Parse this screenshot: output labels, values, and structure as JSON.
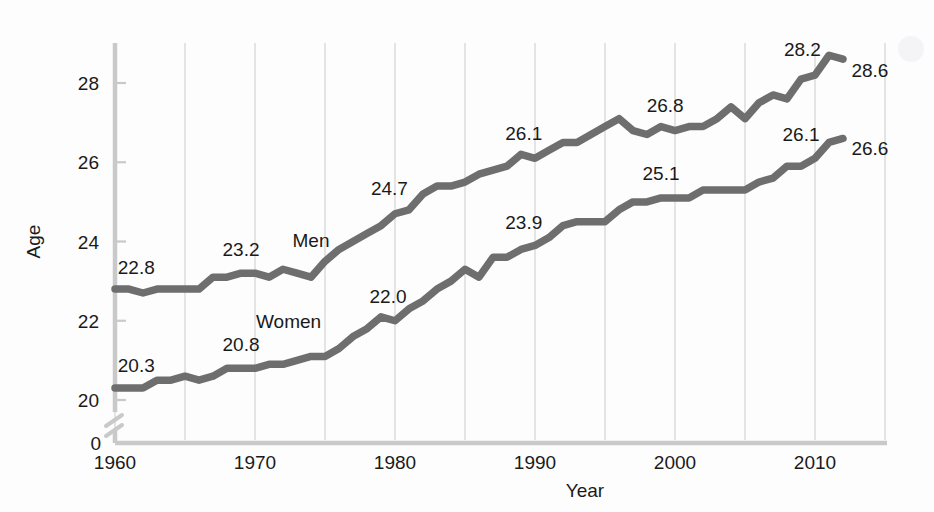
{
  "chart_data": {
    "type": "line",
    "title": "",
    "xlabel": "Year",
    "ylabel": "Age",
    "xlim": [
      1960,
      2015
    ],
    "ylim": [
      19.5,
      29.2
    ],
    "grid": "vertical",
    "legend_position": "inline-labels",
    "xticks": [
      "1960",
      "1970",
      "1980",
      "1990",
      "2000",
      "2010"
    ],
    "xtick_values": [
      1960,
      1970,
      1980,
      1990,
      2000,
      2010
    ],
    "yticks": [
      "0",
      "20",
      "22",
      "24",
      "26",
      "28"
    ],
    "ytick_values": [
      0,
      20,
      22,
      24,
      26,
      28
    ],
    "axis_break": true,
    "line_color": "#6e6e6e",
    "axis_color": "#c9c9c9",
    "grid_color": "#d9d9d9",
    "series": [
      {
        "name": "Men",
        "label_x": 1974.0,
        "label_y": 24.05,
        "x": [
          1960,
          1961,
          1962,
          1963,
          1964,
          1965,
          1966,
          1967,
          1968,
          1969,
          1970,
          1971,
          1972,
          1973,
          1974,
          1975,
          1976,
          1977,
          1978,
          1979,
          1980,
          1981,
          1982,
          1983,
          1984,
          1985,
          1986,
          1987,
          1988,
          1989,
          1990,
          1991,
          1992,
          1993,
          1994,
          1995,
          1996,
          1997,
          1998,
          1999,
          2000,
          2001,
          2002,
          2003,
          2004,
          2005,
          2006,
          2007,
          2008,
          2009,
          2010,
          2011,
          2012
        ],
        "values": [
          22.8,
          22.8,
          22.7,
          22.8,
          22.8,
          22.8,
          22.8,
          23.1,
          23.1,
          23.2,
          23.2,
          23.1,
          23.3,
          23.2,
          23.1,
          23.5,
          23.8,
          24.0,
          24.2,
          24.4,
          24.7,
          24.8,
          25.2,
          25.4,
          25.4,
          25.5,
          25.7,
          25.8,
          25.9,
          26.2,
          26.1,
          26.3,
          26.5,
          26.5,
          26.7,
          26.9,
          27.1,
          26.8,
          26.7,
          26.9,
          26.8,
          26.9,
          26.9,
          27.1,
          27.4,
          27.1,
          27.5,
          27.7,
          27.6,
          28.1,
          28.2,
          28.7,
          28.6
        ]
      },
      {
        "name": "Women",
        "label_x": 1972.4,
        "label_y": 22.0,
        "x": [
          1960,
          1961,
          1962,
          1963,
          1964,
          1965,
          1966,
          1967,
          1968,
          1969,
          1970,
          1971,
          1972,
          1973,
          1974,
          1975,
          1976,
          1977,
          1978,
          1979,
          1980,
          1981,
          1982,
          1983,
          1984,
          1985,
          1986,
          1987,
          1988,
          1989,
          1990,
          1991,
          1992,
          1993,
          1994,
          1995,
          1996,
          1997,
          1998,
          1999,
          2000,
          2001,
          2002,
          2003,
          2004,
          2005,
          2006,
          2007,
          2008,
          2009,
          2010,
          2011,
          2012
        ],
        "values": [
          20.3,
          20.3,
          20.3,
          20.5,
          20.5,
          20.6,
          20.5,
          20.6,
          20.8,
          20.8,
          20.8,
          20.9,
          20.9,
          21.0,
          21.1,
          21.1,
          21.3,
          21.6,
          21.8,
          22.1,
          22.0,
          22.3,
          22.5,
          22.8,
          23.0,
          23.3,
          23.1,
          23.6,
          23.6,
          23.8,
          23.9,
          24.1,
          24.4,
          24.5,
          24.5,
          24.5,
          24.8,
          25.0,
          25.0,
          25.1,
          25.1,
          25.1,
          25.3,
          25.3,
          25.3,
          25.3,
          25.5,
          25.6,
          25.9,
          25.9,
          26.1,
          26.5,
          26.6
        ]
      }
    ],
    "annotations": [
      {
        "text": "22.8",
        "x": 1960.2,
        "y": 23.35,
        "anchor": "start",
        "series": "Men"
      },
      {
        "text": "23.2",
        "x": 1969.0,
        "y": 23.82,
        "anchor": "middle",
        "series": "Men"
      },
      {
        "text": "24.7",
        "x": 1979.6,
        "y": 25.35,
        "anchor": "middle",
        "series": "Men"
      },
      {
        "text": "26.1",
        "x": 1989.2,
        "y": 26.75,
        "anchor": "middle",
        "series": "Men"
      },
      {
        "text": "26.8",
        "x": 1999.3,
        "y": 27.45,
        "anchor": "middle",
        "series": "Men"
      },
      {
        "text": "28.2",
        "x": 2009.1,
        "y": 28.85,
        "anchor": "middle",
        "series": "Men"
      },
      {
        "text": "28.6",
        "x": 2012.6,
        "y": 28.33,
        "anchor": "start",
        "series": "Men"
      },
      {
        "text": "20.3",
        "x": 1960.2,
        "y": 20.88,
        "anchor": "start",
        "series": "Women"
      },
      {
        "text": "20.8",
        "x": 1969.0,
        "y": 21.42,
        "anchor": "middle",
        "series": "Women"
      },
      {
        "text": "22.0",
        "x": 1979.5,
        "y": 22.62,
        "anchor": "middle",
        "series": "Women"
      },
      {
        "text": "23.9",
        "x": 1989.2,
        "y": 24.5,
        "anchor": "middle",
        "series": "Women"
      },
      {
        "text": "25.1",
        "x": 1999.0,
        "y": 25.72,
        "anchor": "middle",
        "series": "Women"
      },
      {
        "text": "26.1",
        "x": 2009.0,
        "y": 26.72,
        "anchor": "middle",
        "series": "Women"
      },
      {
        "text": "26.6",
        "x": 2012.6,
        "y": 26.35,
        "anchor": "start",
        "series": "Women"
      }
    ]
  }
}
